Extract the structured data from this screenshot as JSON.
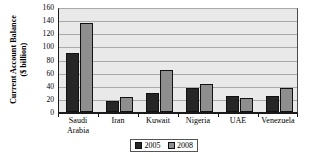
{
  "chart_data": {
    "type": "bar",
    "title": "",
    "xlabel": "",
    "ylabel": "Current Account Balance ($ billion)",
    "ylabel_line1": "Current Account Balance",
    "ylabel_line2": "($ billion)",
    "categories": [
      "Saudi\nArabia",
      "Iran",
      "Kuwait",
      "Nigeria",
      "UAE",
      "Venezuela"
    ],
    "series": [
      {
        "name": "2005",
        "color": "#262626",
        "values": [
          90,
          17,
          29,
          36,
          24,
          25
        ]
      },
      {
        "name": "2008",
        "color": "#8e8e8e",
        "values": [
          135,
          23,
          64,
          42,
          21,
          36
        ]
      }
    ],
    "ylim": [
      0,
      160
    ],
    "ytick_values": [
      0,
      20,
      40,
      60,
      80,
      100,
      120,
      140,
      160
    ],
    "ytick_labels": [
      "0",
      "20",
      "40",
      "60",
      "80",
      "100",
      "120",
      "140",
      "160"
    ],
    "grid": true,
    "legend_position": "bottom-center",
    "plot_background": "#e9e9e9",
    "gridline_color": "#a9a9a9"
  }
}
